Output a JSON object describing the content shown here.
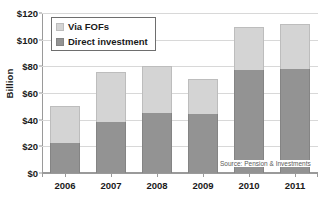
{
  "chart_data": {
    "type": "bar",
    "subtype": "stacked-vertical",
    "title": "",
    "xlabel": "",
    "ylabel": "Billion",
    "categories": [
      "2006",
      "2007",
      "2008",
      "2009",
      "2010",
      "2011"
    ],
    "series": [
      {
        "name": "Direct investment",
        "color": "#939393",
        "values": [
          22.5,
          38,
          45,
          44,
          77,
          78
        ]
      },
      {
        "name": "Via FOFs",
        "color": "#d4d4d4",
        "values": [
          27.5,
          38,
          35,
          26.5,
          32.5,
          33.5
        ]
      }
    ],
    "stack_totals": [
      50,
      76,
      80,
      70.5,
      109.5,
      111.5
    ],
    "ylim": [
      0,
      120
    ],
    "ytick_values": [
      0,
      20,
      40,
      60,
      80,
      100,
      120
    ],
    "ytick_labels": [
      "$0",
      "$20",
      "$40",
      "$60",
      "$80",
      "$100",
      "$120"
    ],
    "grid": true,
    "legend_position": "top-left",
    "annotations": [
      "Source: Pension & Investments"
    ]
  },
  "axes": {
    "y_title": "Billion",
    "y_ticks": [
      "$0",
      "$20",
      "$40",
      "$60",
      "$80",
      "$100",
      "$120"
    ],
    "x_ticks": [
      "2006",
      "2007",
      "2008",
      "2009",
      "2010",
      "2011"
    ]
  },
  "legend": {
    "items": [
      {
        "label": "Via FOFs",
        "key": "fof"
      },
      {
        "label": "Direct investment",
        "key": "direct"
      }
    ]
  },
  "source": {
    "text": "Source: Pension & Investments"
  },
  "colors": {
    "fof": "#d4d4d4",
    "direct": "#939393",
    "grid": "#d8d8d8",
    "axis": "#9a9a9a",
    "text": "#1a1a1a"
  }
}
